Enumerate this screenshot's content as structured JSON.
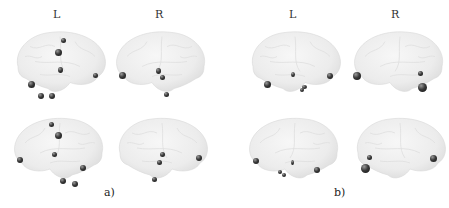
{
  "figure": {
    "panels": [
      {
        "caption": "a)",
        "hemisphere_labels": [
          "L",
          "R"
        ]
      },
      {
        "caption": "b)",
        "hemisphere_labels": [
          "L",
          "R"
        ]
      }
    ]
  },
  "colors": {
    "brain_surface": "#ececec",
    "brain_shadow": "#d6d6d6",
    "node": "#222222",
    "background": "#ffffff"
  }
}
